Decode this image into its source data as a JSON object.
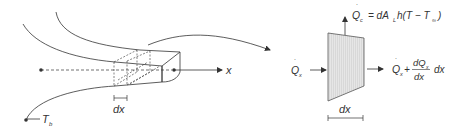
{
  "diagram": {
    "colors": {
      "stroke": "#333333",
      "element_fill": "#dcdcdc",
      "background": "#ffffff"
    },
    "left_panel": {
      "axis_label": "x",
      "element_width_label": "dx",
      "base_temperature_label": "T",
      "base_temperature_sub": "b"
    },
    "right_panel": {
      "convection": {
        "q": "Q",
        "q_sub": "c",
        "equals": "= dA",
        "area_sub": "L",
        "rest": "h(T − T",
        "inf_sub": "∞",
        "close": ")"
      },
      "inflow": {
        "q": "Q",
        "q_sub": "x"
      },
      "outflow": {
        "q": "Q",
        "q_sub": "x",
        "plus": "+",
        "numerator": "dQ",
        "numerator_sub": "x",
        "denominator": "dx",
        "trailing": "dx"
      },
      "element_width_label": "dx"
    }
  }
}
